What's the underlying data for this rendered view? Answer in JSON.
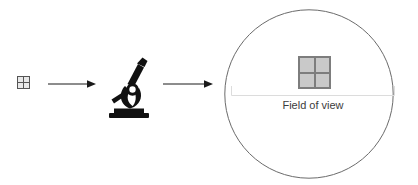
{
  "diagram": {
    "background_color": "#ffffff",
    "specimen_small": {
      "icon": "grid-2x2-icon",
      "rows": 2,
      "columns": 2,
      "cell_color": "#e8e8e8",
      "border_color": "#555555"
    },
    "arrow_one": {
      "icon": "arrow-right-icon",
      "color": "#1a1a1a"
    },
    "microscope": {
      "icon": "microscope-icon",
      "color": "#111111"
    },
    "arrow_two": {
      "icon": "arrow-right-icon",
      "color": "#1a1a1a"
    },
    "field_of_view": {
      "icon": "circle-outline-icon",
      "outline_color": "#6b6b6b",
      "bracket_color": "#dcdcdc",
      "label": "Field of view",
      "label_color": "#3c3c3c",
      "specimen_magnified": {
        "icon": "grid-2x2-icon",
        "rows": 2,
        "columns": 2,
        "cell_color": "#c9c9c9",
        "border_color": "#7d7d7d"
      }
    }
  }
}
